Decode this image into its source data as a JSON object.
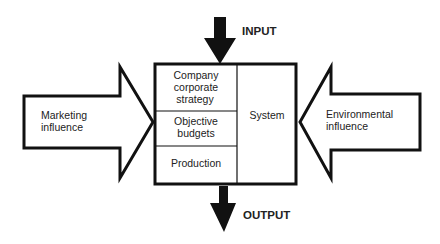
{
  "diagram": {
    "colors": {
      "stroke": "#111111",
      "fill": "#ffffff",
      "text": "#222222"
    },
    "input": {
      "label": "INPUT",
      "direction": "down"
    },
    "output": {
      "label": "OUTPUT",
      "direction": "down"
    },
    "system_box": {
      "left_column": [
        {
          "lines": [
            "Company",
            "corporate",
            "strategy"
          ]
        },
        {
          "lines": [
            "Objective",
            "budgets"
          ]
        },
        {
          "lines": [
            "Production"
          ]
        }
      ],
      "right_column": {
        "label": "System"
      }
    },
    "left_arrow": {
      "lines": [
        "Marketing",
        "influence"
      ],
      "direction": "right"
    },
    "right_arrow": {
      "lines": [
        "Environmental",
        "influence"
      ],
      "direction": "left"
    }
  }
}
